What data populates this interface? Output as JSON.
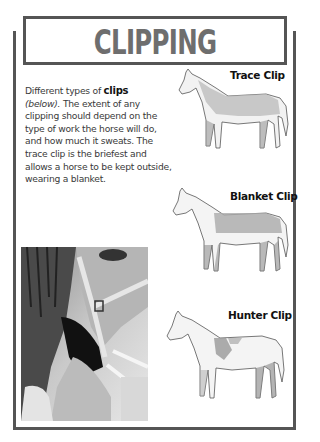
{
  "page": {
    "title": "CLIPPING",
    "intro": {
      "prefix": "Different types of ",
      "bold": "clips",
      "italic": "(below).",
      "rest": " The extent of any clipping should depend on the type of work the horse will do, and how much it sweats. The trace clip is the briefest and allows a horse to be kept outside, wearing a blanket."
    },
    "illustrations": [
      {
        "caption": "Trace Clip",
        "icon": "horse-trace-clip-icon"
      },
      {
        "caption": "Blanket Clip",
        "icon": "horse-blanket-clip-icon"
      },
      {
        "caption": "Hunter Clip",
        "icon": "horse-hunter-clip-icon"
      }
    ],
    "photo": {
      "description": "Black and white photo of a person holding a horse's head with a halter"
    },
    "colors": {
      "frame": "#555555",
      "title": "#6e6e6e",
      "text": "#3a3a3a"
    }
  }
}
